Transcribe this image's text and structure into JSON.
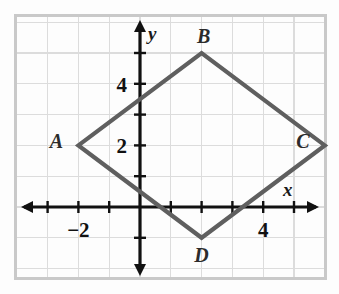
{
  "figure": {
    "background_color": "#fdfdfd",
    "border_color": "#c9c9c9",
    "grid_color": "#dcdcdc",
    "axis_color": "#111111",
    "shape_color": "#5f5f5f"
  },
  "chart_data": {
    "type": "scatter",
    "title": "",
    "xlabel": "x",
    "ylabel": "y",
    "xlim": [
      -3.1,
      6.9
    ],
    "ylim": [
      -2.1,
      6.0
    ],
    "grid": true,
    "legend": "none",
    "x_tick_labels": [
      {
        "value": -2,
        "text": "−2"
      },
      {
        "value": 4,
        "text": "4"
      }
    ],
    "y_tick_labels": [
      {
        "value": 2,
        "text": "2"
      },
      {
        "value": 4,
        "text": "4"
      }
    ],
    "x_ticks": [
      -3,
      -2,
      -1,
      1,
      2,
      3,
      4,
      5,
      6
    ],
    "y_ticks": [
      -1,
      1,
      2,
      3,
      4,
      5
    ],
    "series": [
      {
        "name": "Quadrilateral ABCD",
        "shape": "rhombus",
        "closed": true,
        "points": [
          {
            "label": "A",
            "x": -2,
            "y": 2,
            "label_dx": -22,
            "label_dy": 3
          },
          {
            "label": "B",
            "x": 2,
            "y": 5,
            "label_dx": 2,
            "label_dy": -10
          },
          {
            "label": "C",
            "x": 6,
            "y": 2,
            "label_dx": -22,
            "label_dy": 3
          },
          {
            "label": "D",
            "x": 2,
            "y": -1,
            "label_dx": 0,
            "label_dy": 24
          }
        ]
      }
    ]
  },
  "axes": {
    "x_axis_name": "x",
    "y_axis_name": "y"
  }
}
